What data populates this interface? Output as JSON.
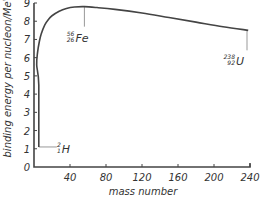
{
  "chart_data": {
    "type": "line",
    "title": "",
    "xlabel": "mass number",
    "ylabel": "binding energy per nucleon/MeV",
    "xlim": [
      0,
      240
    ],
    "ylim": [
      0,
      9
    ],
    "xticks": [
      40,
      80,
      120,
      160,
      200,
      240
    ],
    "yticks": [
      0,
      1,
      2,
      3,
      4,
      5,
      6,
      7,
      8,
      9
    ],
    "grid": false,
    "legend": null,
    "series": [
      {
        "name": "binding energy per nucleon",
        "color": "#444444",
        "x": [
          2,
          2,
          3,
          4,
          6,
          8,
          12,
          16,
          20,
          28,
          36,
          45,
          56,
          70,
          90,
          120,
          150,
          180,
          210,
          238
        ],
        "y": [
          1.1,
          4.5,
          5.6,
          6.3,
          6.9,
          7.3,
          7.8,
          8.1,
          8.3,
          8.55,
          8.7,
          8.78,
          8.8,
          8.75,
          8.65,
          8.45,
          8.2,
          7.95,
          7.7,
          7.5
        ]
      }
    ],
    "annotations": [
      {
        "label": "Fe",
        "mass": "56",
        "atomic": "26",
        "x": 56,
        "y": 8.8,
        "marker": "line-down",
        "color": "#999999"
      },
      {
        "label": "U",
        "mass": "238",
        "atomic": "92",
        "x": 238,
        "y": 7.5,
        "marker": "line-down",
        "color": "#999999"
      },
      {
        "label": "H",
        "mass": "2",
        "atomic": "1",
        "x": 2,
        "y": 1.1,
        "marker": "line-right",
        "color": "#999999"
      }
    ]
  }
}
